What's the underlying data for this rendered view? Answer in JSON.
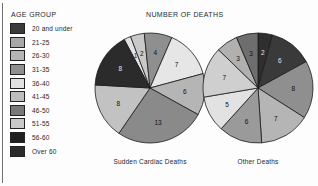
{
  "legend": {
    "title": "AGE GROUP",
    "items": [
      {
        "label": "20 and under",
        "color": "#3a3a3a"
      },
      {
        "label": "21-25",
        "color": "#a8a8a8"
      },
      {
        "label": "26-30",
        "color": "#b5b5b5"
      },
      {
        "label": "31-35",
        "color": "#8f8f8f"
      },
      {
        "label": "36-40",
        "color": "#e2e2e2"
      },
      {
        "label": "41-45",
        "color": "#bdbdbd"
      },
      {
        "label": "46-50",
        "color": "#787878"
      },
      {
        "label": "51-55",
        "color": "#c9c9c9"
      },
      {
        "label": "56-60",
        "color": "#1f1f1f"
      },
      {
        "label": "Over 60",
        "color": "#2b2b2b"
      }
    ]
  },
  "chart_data": [
    {
      "type": "pie",
      "title": "NUMBER OF DEATHS",
      "caption": "Sudden Cardiac Deaths",
      "categories": [
        "20 and under",
        "21-25",
        "26-30",
        "31-35",
        "36-40",
        "41-45",
        "46-50",
        "51-55",
        "56-60",
        "Over 60"
      ],
      "values": [
        1,
        2,
        4,
        7,
        6,
        13,
        8,
        0,
        0,
        8
      ],
      "labels": [
        "1",
        "2",
        "4",
        "7",
        "6",
        "13",
        "8",
        "",
        "",
        "8"
      ],
      "colors": [
        "#e2e2e2",
        "#c9c9c9",
        "#8f8f8f",
        "#e6e6e6",
        "#b5b5b5",
        "#8a8a8a",
        "#c2c2c2",
        "#a8a8a8",
        "#1f1f1f",
        "#2b2b2b"
      ],
      "legend_position": "left",
      "grid": false
    },
    {
      "type": "pie",
      "title": "NUMBER OF DEATHS",
      "caption": "Other Deaths",
      "categories": [
        "20 and under",
        "21-25",
        "26-30",
        "31-35",
        "36-40",
        "41-45",
        "46-50",
        "51-55",
        "56-60",
        "Over 60"
      ],
      "values": [
        2,
        6,
        8,
        7,
        6,
        5,
        7,
        3,
        3,
        0
      ],
      "labels": [
        "2",
        "6",
        "8",
        "7",
        "6",
        "5",
        "7",
        "3",
        "3",
        ""
      ],
      "colors": [
        "#2f2f2f",
        "#3a3a3a",
        "#8f8f8f",
        "#b5b5b5",
        "#9a9a9a",
        "#e2e2e2",
        "#cfcfcf",
        "#b0b0b0",
        "#6e6e6e",
        "#c9c9c9"
      ],
      "legend_position": "left",
      "grid": false
    }
  ]
}
